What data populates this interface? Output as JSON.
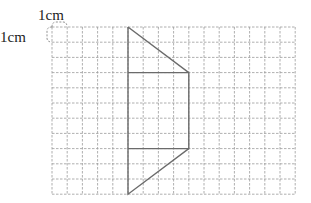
{
  "diagram": {
    "type": "grid-figure",
    "unit_labels": {
      "top": "1cm",
      "left": "1cm"
    },
    "grid": {
      "columns": 16,
      "rows": 11,
      "cell_size_cm": 1,
      "origin_px": [
        52,
        27
      ],
      "cell_px": 15.2,
      "line_color": "#9a9a9a",
      "line_style": "dashed"
    },
    "shape": {
      "stroke_color": "#6b6b6b",
      "vertices_grid": [
        [
          5,
          0
        ],
        [
          9,
          4
        ],
        [
          9,
          8
        ],
        [
          5,
          11
        ]
      ],
      "inner_horizontal_lines_grid": [
        {
          "from": [
            5,
            3
          ],
          "to": [
            9,
            3
          ]
        },
        {
          "from": [
            5,
            8
          ],
          "to": [
            9,
            8
          ]
        }
      ],
      "description": "Figure made of a right triangle on top, a rectangle in the middle, and a right triangle at the bottom, sharing a vertical left edge"
    }
  }
}
